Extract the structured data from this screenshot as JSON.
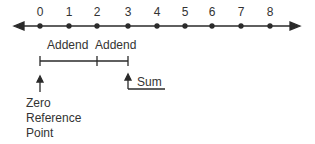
{
  "diagram": {
    "type": "number-line-addition",
    "number_line": {
      "ticks": [
        "0",
        "1",
        "2",
        "3",
        "4",
        "5",
        "6",
        "7",
        "8"
      ],
      "arrows": "both-ends"
    },
    "addends": [
      {
        "label": "Addend",
        "from": 0,
        "to": 2
      },
      {
        "label": "Addend",
        "from": 2,
        "to": 3
      }
    ],
    "sum": {
      "label": "Sum",
      "at": 3
    },
    "reference": {
      "lines": [
        "Zero",
        "Reference",
        "Point"
      ],
      "at": 0
    }
  }
}
